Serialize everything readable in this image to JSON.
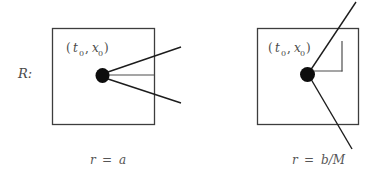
{
  "figure": {
    "row_label": "R:",
    "panels": [
      {
        "id": "panel-left",
        "event_label": "(t₀, x₀)",
        "event_label_parts": {
          "open_paren": "(",
          "t_symbol": "t",
          "t_subscript": "0",
          "comma": ",",
          "x_symbol": "x",
          "x_subscript": "0",
          "close_paren": ")"
        },
        "caption": "r = a",
        "caption_parts": {
          "variable": "r",
          "equals": "=",
          "value": "a"
        },
        "geometry_note": "three rays fan outward to the right from the event point; the middle ray is horizontal and terminates at the box edge",
        "ray_count": 3
      },
      {
        "id": "panel-right",
        "event_label": "(t₀, x₀)",
        "event_label_parts": {
          "open_paren": "(",
          "t_symbol": "t",
          "t_subscript": "0",
          "comma": ",",
          "x_symbol": "x",
          "x_subscript": "0",
          "close_paren": ")"
        },
        "caption": "r = b/M",
        "caption_parts": {
          "variable": "r",
          "equals": "=",
          "value": "b/M"
        },
        "geometry_note": "a single steep line passes through the event point and extends beyond the box top and bottom; an elbow connects the event point rightward then upward",
        "ray_count": 1
      }
    ],
    "colors": {
      "background": "#ffffff",
      "box_stroke": "#3d3d3d",
      "ray_stroke": "#1c1c1c",
      "thin_stroke": "#4d4d4d",
      "dot_fill": "#0d0d0d",
      "text_fill": "#4a4a4a",
      "caption_fill": "#555555"
    }
  }
}
